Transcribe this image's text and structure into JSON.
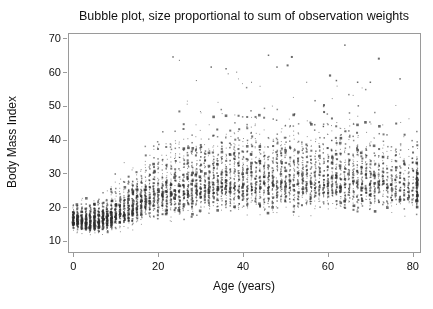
{
  "chart_data": {
    "type": "scatter",
    "subtype": "bubble",
    "title": "Bubble plot, size proportional to sum of observation weights",
    "xlabel": "Age (years)",
    "ylabel": "Body Mass Index",
    "x_ticks": [
      0,
      20,
      40,
      60,
      80
    ],
    "y_ticks": [
      10,
      20,
      30,
      40,
      50,
      60,
      70
    ],
    "xlim": [
      -1.25,
      81.7
    ],
    "ylim": [
      6.7,
      71.6
    ],
    "grid": false,
    "legend": "none",
    "background": "#ffffff",
    "axis_color": "#9a9a9a",
    "text_color": "#111111",
    "marker_color_rgb": [
      45,
      45,
      45
    ],
    "point_style": "square",
    "generation": {
      "seed": 1337,
      "age_min": 0,
      "age_max": 81,
      "x_jitter_px": 1.4,
      "counts": [
        [
          0,
          110
        ],
        [
          9,
          110
        ],
        [
          10,
          85
        ],
        [
          17,
          85
        ],
        [
          18,
          60
        ],
        [
          25,
          60
        ],
        [
          26,
          65
        ],
        [
          50,
          65
        ],
        [
          51,
          55
        ],
        [
          70,
          55
        ],
        [
          71,
          40
        ],
        [
          79,
          40
        ],
        [
          80,
          30
        ],
        [
          81,
          130
        ]
      ],
      "median_bmi": [
        [
          0,
          16.2
        ],
        [
          3,
          15.7
        ],
        [
          6,
          15.8
        ],
        [
          10,
          17.6
        ],
        [
          14,
          19.8
        ],
        [
          18,
          23.0
        ],
        [
          25,
          25.5
        ],
        [
          35,
          27.0
        ],
        [
          50,
          27.8
        ],
        [
          65,
          27.8
        ],
        [
          75,
          27.0
        ],
        [
          81,
          26.5
        ]
      ],
      "sigma_low": [
        [
          0,
          0.08
        ],
        [
          10,
          0.11
        ],
        [
          18,
          0.15
        ],
        [
          30,
          0.16
        ],
        [
          81,
          0.15
        ]
      ],
      "sigma_high": [
        [
          0,
          0.1
        ],
        [
          10,
          0.17
        ],
        [
          18,
          0.23
        ],
        [
          30,
          0.25
        ],
        [
          60,
          0.24
        ],
        [
          81,
          0.2
        ]
      ],
      "bmi_floor": 11.5,
      "bmi_cap": 58,
      "size_classes": [
        {
          "prob": 0.55,
          "size": 1.0,
          "alpha": 0.5
        },
        {
          "prob": 0.3,
          "size": 1.5,
          "alpha": 0.58
        },
        {
          "prob": 0.12,
          "size": 2.0,
          "alpha": 0.66
        },
        {
          "prob": 0.03,
          "size": 2.6,
          "alpha": 0.72
        }
      ]
    },
    "outliers": [
      {
        "age": 23.5,
        "bmi": 64.5,
        "size": 1.5
      },
      {
        "age": 25.0,
        "bmi": 63.5,
        "size": 1.0
      },
      {
        "age": 32.5,
        "bmi": 61.5,
        "size": 1.5
      },
      {
        "age": 36.0,
        "bmi": 61.0,
        "size": 1.5
      },
      {
        "age": 36.5,
        "bmi": 59.5,
        "size": 1.0
      },
      {
        "age": 38.5,
        "bmi": 60.0,
        "size": 1.0
      },
      {
        "age": 42.0,
        "bmi": 57.0,
        "size": 1.0
      },
      {
        "age": 46.0,
        "bmi": 65.0,
        "size": 1.5
      },
      {
        "age": 48.0,
        "bmi": 61.5,
        "size": 1.5
      },
      {
        "age": 50.5,
        "bmi": 62.0,
        "size": 2.0
      },
      {
        "age": 51.5,
        "bmi": 64.5,
        "size": 2.0
      },
      {
        "age": 55.0,
        "bmi": 57.0,
        "size": 1.0
      },
      {
        "age": 60.5,
        "bmi": 59.0,
        "size": 2.2
      },
      {
        "age": 62.0,
        "bmi": 57.5,
        "size": 1.5
      },
      {
        "age": 64.0,
        "bmi": 68.0,
        "size": 1.5
      },
      {
        "age": 67.0,
        "bmi": 57.0,
        "size": 1.5
      },
      {
        "age": 70.0,
        "bmi": 57.0,
        "size": 1.5
      },
      {
        "age": 72.0,
        "bmi": 64.0,
        "size": 2.0
      },
      {
        "age": 77.0,
        "bmi": 58.0,
        "size": 1.5
      },
      {
        "age": 29.0,
        "bmi": 57.5,
        "size": 1.0
      }
    ]
  }
}
